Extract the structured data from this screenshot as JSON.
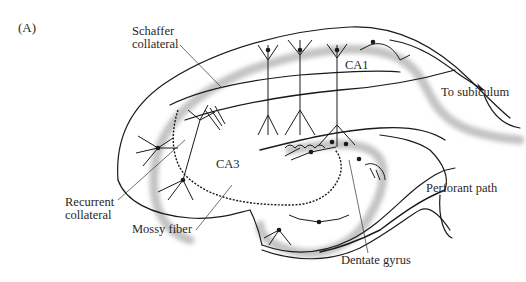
{
  "figure": {
    "panel_label": "(A)"
  },
  "labels": {
    "schaffer_1": "Schaffer",
    "schaffer_2": "collateral",
    "ca1": "CA1",
    "to_subiculum": "To subiculum",
    "ca3": "CA3",
    "recurrent_1": "Recurrent",
    "recurrent_2": "collateral",
    "mossy_fiber": "Mossy fiber",
    "perforant_path": "Perforant path",
    "dentate_gyrus": "Dentate gyrus"
  },
  "colors": {
    "line": "#1a1a1a",
    "cell_layer": "#c8c8c8",
    "text": "#2b2729"
  }
}
